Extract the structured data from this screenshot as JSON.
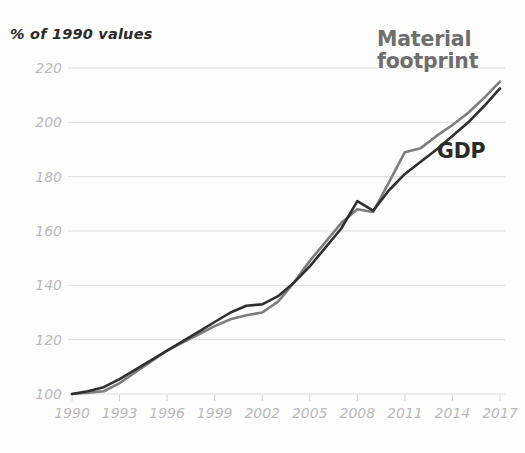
{
  "chart_data": {
    "type": "line",
    "title": "",
    "ylabel": "% of 1990 values",
    "xlabel": "",
    "ylim": [
      100,
      228
    ],
    "xlim": [
      1990,
      2017
    ],
    "grid": true,
    "grid_axis": "y",
    "legend_position": "inline-right",
    "yticks": [
      100,
      120,
      140,
      160,
      180,
      200,
      220
    ],
    "xticks": [
      1990,
      1993,
      1996,
      1999,
      2002,
      2005,
      2008,
      2011,
      2014,
      2017
    ],
    "x": [
      1990,
      1991,
      1992,
      1993,
      1994,
      1995,
      1996,
      1997,
      1998,
      1999,
      2000,
      2001,
      2002,
      2003,
      2004,
      2005,
      2006,
      2007,
      2008,
      2009,
      2010,
      2011,
      2012,
      2013,
      2014,
      2015,
      2016,
      2017
    ],
    "series": [
      {
        "name": "Material footprint",
        "color": "#7d7d7d",
        "values": [
          100,
          100.5,
          101,
          104,
          108,
          112,
          116,
          119,
          122,
          125,
          127.5,
          129,
          130,
          134,
          141,
          149,
          156,
          163,
          168,
          167,
          178,
          189,
          190.5,
          195,
          199,
          203.5,
          209,
          215
        ]
      },
      {
        "name": "GDP",
        "color": "#2f2f2f",
        "values": [
          100,
          101,
          102.5,
          105.5,
          109,
          112.5,
          116,
          119.5,
          123,
          126.5,
          130,
          132.5,
          133,
          136,
          141,
          147,
          154,
          161,
          171,
          167.5,
          175,
          181,
          185.5,
          190,
          195,
          200,
          206,
          212.5
        ]
      }
    ],
    "annotations": [
      {
        "text": "Material\nfootprint",
        "series": "Material footprint"
      },
      {
        "text": "GDP",
        "series": "GDP"
      }
    ]
  },
  "labels": {
    "axis_title": "% of 1990 values",
    "material_footprint": "Material\nfootprint",
    "gdp": "GDP"
  },
  "colors": {
    "material_footprint": "#7d7d7d",
    "gdp": "#2f2f2f",
    "grid": "#dcdcdc",
    "tick_text": "#b9b9b9",
    "background": "#fdfdfc"
  }
}
